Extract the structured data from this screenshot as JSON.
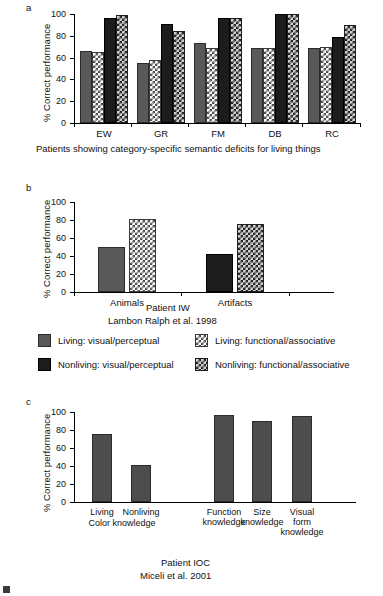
{
  "figure": {
    "y_axis_label": "% Correct performance",
    "y_ticks": [
      "0",
      "20",
      "40",
      "60",
      "80",
      "100"
    ]
  },
  "panels": {
    "a": {
      "letter": "a",
      "caption": "Patients showing category-specific semantic deficits for living things",
      "chart_data": {
        "type": "bar",
        "title": "",
        "xlabel": "Patients showing category-specific semantic deficits for living things",
        "ylabel": "% Correct performance",
        "ylim": [
          0,
          100
        ],
        "yticks": [
          0,
          20,
          40,
          60,
          80,
          100
        ],
        "grid": false,
        "legend_position": "below-figure",
        "categories": [
          "EW",
          "GR",
          "FM",
          "DB",
          "RC"
        ],
        "series": [
          {
            "name": "Living: visual/perceptual",
            "values": [
              66,
              55,
              73,
              69,
              69
            ]
          },
          {
            "name": "Living: functional/associative",
            "values": [
              65,
              58,
              69,
              69,
              70
            ]
          },
          {
            "name": "Nonliving: visual/perceptual",
            "values": [
              96,
              91,
              96,
              100,
              79
            ]
          },
          {
            "name": "Nonliving: functional/associative",
            "values": [
              99,
              84,
              96,
              100,
              90
            ]
          }
        ]
      }
    },
    "b": {
      "letter": "b",
      "caption_line1": "Patient IW",
      "caption_line2": "Lambon Ralph et al. 1998",
      "chart_data": {
        "type": "bar",
        "title": "",
        "xlabel": "Patient IW",
        "ylabel": "% Correct performance",
        "ylim": [
          0,
          100
        ],
        "yticks": [
          0,
          20,
          40,
          60,
          80,
          100
        ],
        "grid": false,
        "categories": [
          "Animals",
          "Artifacts"
        ],
        "bars": [
          {
            "category": "Animals",
            "series": "Living: visual/perceptual",
            "value": 50
          },
          {
            "category": "Animals",
            "series": "Living: functional/associative",
            "value": 81
          },
          {
            "category": "Artifacts",
            "series": "Nonliving: visual/perceptual",
            "value": 42
          },
          {
            "category": "Artifacts",
            "series": "Nonliving: functional/associative",
            "value": 76
          }
        ]
      }
    },
    "c": {
      "letter": "c",
      "caption_line1": "Patient IOC",
      "caption_line2": "Miceli et al. 2001",
      "chart_data": {
        "type": "bar",
        "title": "",
        "xlabel": "Patient IOC",
        "ylabel": "% Correct performance",
        "ylim": [
          0,
          100
        ],
        "yticks": [
          0,
          20,
          40,
          60,
          80,
          100
        ],
        "grid": false,
        "categories": [
          "Living",
          "Nonliving",
          "Function knowledge",
          "Size knowledge",
          "Visual form knowledge"
        ],
        "group_labels": [
          "Color knowledge"
        ],
        "values": [
          76,
          41,
          97,
          90,
          96
        ]
      }
    }
  },
  "legend": {
    "items": [
      {
        "label": "Living: visual/perceptual",
        "swatch": "living-visual-perceptual-swatch"
      },
      {
        "label": "Living: functional/associative",
        "swatch": "living-functional-associative-swatch"
      },
      {
        "label": "Nonliving: visual/perceptual",
        "swatch": "nonliving-visual-perceptual-swatch"
      },
      {
        "label": "Nonliving: functional/associative",
        "swatch": "nonliving-functional-associative-swatch"
      }
    ]
  }
}
